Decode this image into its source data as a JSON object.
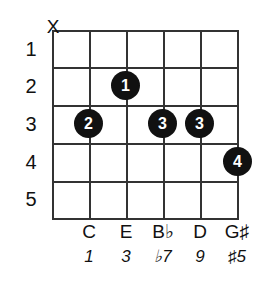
{
  "diagram": {
    "type": "guitar-chord-diagram",
    "instrument": "guitar",
    "string_count": 6,
    "fret_count": 5,
    "colors": {
      "grid": "#333333",
      "dot_fill": "#111111",
      "dot_text": "#ffffff",
      "background": "#ffffff"
    }
  },
  "fret_numbers": [
    {
      "label": "1",
      "fret": 1
    },
    {
      "label": "2",
      "fret": 2
    },
    {
      "label": "3",
      "fret": 3
    },
    {
      "label": "4",
      "fret": 4
    },
    {
      "label": "5",
      "fret": 5
    }
  ],
  "string_markers": [
    {
      "string": 1,
      "symbol": "X",
      "meaning": "muted"
    }
  ],
  "finger_dots": [
    {
      "finger": "1",
      "string": 3,
      "fret": 2
    },
    {
      "finger": "2",
      "string": 2,
      "fret": 3
    },
    {
      "finger": "3",
      "string": 4,
      "fret": 3
    },
    {
      "finger": "3",
      "string": 5,
      "fret": 3
    },
    {
      "finger": "4",
      "string": 6,
      "fret": 4
    }
  ],
  "note_labels": [
    {
      "string": 2,
      "note": "C"
    },
    {
      "string": 3,
      "note": "E"
    },
    {
      "string": 4,
      "note": "B♭"
    },
    {
      "string": 5,
      "note": "D"
    },
    {
      "string": 6,
      "note": "G♯"
    }
  ],
  "interval_labels": [
    {
      "string": 2,
      "interval": "1"
    },
    {
      "string": 3,
      "interval": "3"
    },
    {
      "string": 4,
      "interval": "♭7"
    },
    {
      "string": 5,
      "interval": "9"
    },
    {
      "string": 6,
      "interval": "♯5"
    }
  ]
}
